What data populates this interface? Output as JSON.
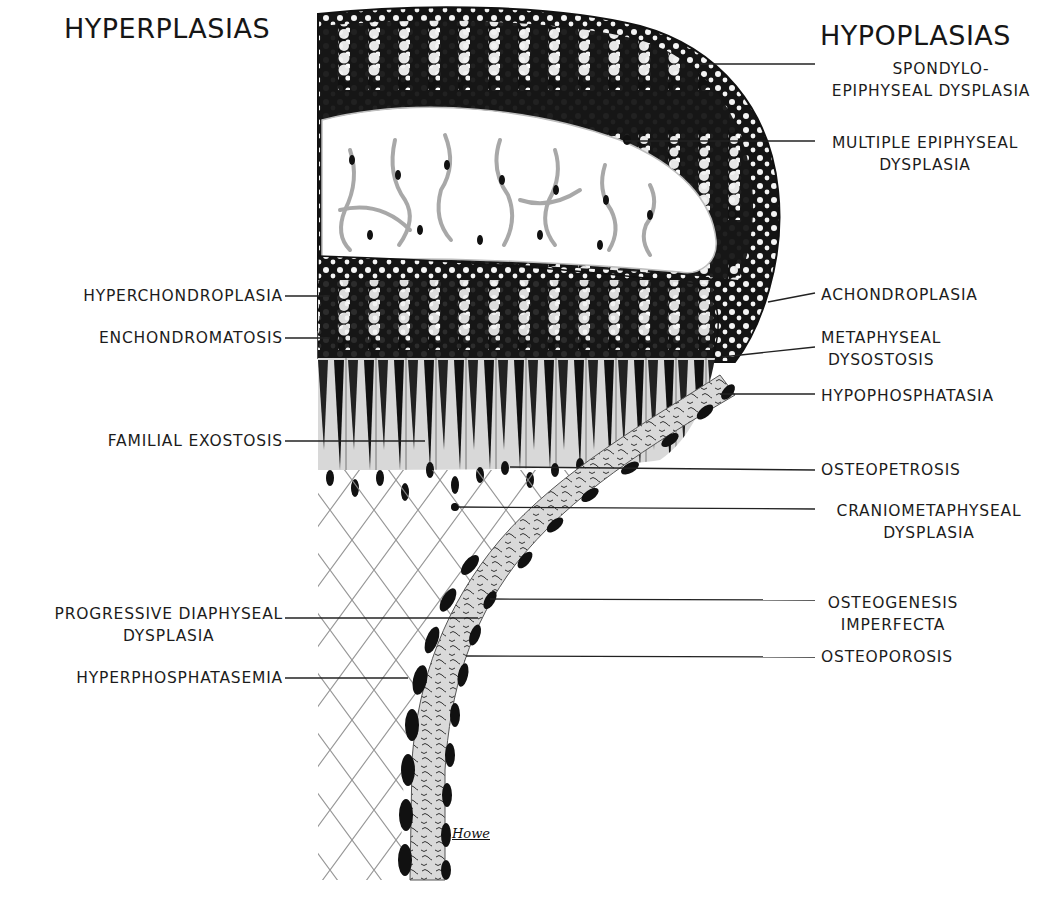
{
  "diagram": {
    "type": "anatomical-illustration",
    "headings": {
      "left": "HYPERPLASIAS",
      "right": "HYPOPLASIAS"
    },
    "left_labels": [
      {
        "id": "hyperchondroplasia",
        "lines": [
          "HYPERCHONDROPLASIA"
        ],
        "y": 296
      },
      {
        "id": "enchondromatosis",
        "lines": [
          "ENCHONDROMATOSIS"
        ],
        "y": 338
      },
      {
        "id": "familial-exostosis",
        "lines": [
          "FAMILIAL EXOSTOSIS"
        ],
        "y": 441
      },
      {
        "id": "progressive-diaphyseal-dysplasia",
        "lines": [
          "PROGRESSIVE DIAPHYSEAL",
          "DYSPLASIA"
        ],
        "y": 618
      },
      {
        "id": "hyperphosphatasemia",
        "lines": [
          "HYPERPHOSPHATASEMIA"
        ],
        "y": 678
      }
    ],
    "right_labels": [
      {
        "id": "spondylo-epiphyseal-dysplasia",
        "lines": [
          "SPONDYLO-",
          "EPIPHYSEAL DYSPLASIA"
        ],
        "y": 66
      },
      {
        "id": "multiple-epiphyseal-dysplasia",
        "lines": [
          "MULTIPLE EPIPHYSEAL",
          "DYSPLASIA"
        ],
        "y": 142
      },
      {
        "id": "achondroplasia",
        "lines": [
          "ACHONDROPLASIA"
        ],
        "y": 296
      },
      {
        "id": "metaphyseal-dysostosis",
        "lines": [
          "METAPHYSEAL",
          "DYSOSTOSIS"
        ],
        "y": 348
      },
      {
        "id": "hypophosphatasia",
        "lines": [
          "HYPOPHOSPHATASIA"
        ],
        "y": 396
      },
      {
        "id": "osteopetrosis",
        "lines": [
          "OSTEOPETROSIS"
        ],
        "y": 470
      },
      {
        "id": "craniometaphyseal-dysplasia",
        "lines": [
          "CRANIOMETAPHYSEAL",
          "DYSPLASIA"
        ],
        "y": 509
      },
      {
        "id": "osteogenesis-imperfecta",
        "lines": [
          "OSTEOGENESIS",
          "IMPERFECTA"
        ],
        "y": 600
      },
      {
        "id": "osteoporosis",
        "lines": [
          "OSTEOPOROSIS"
        ],
        "y": 657
      }
    ],
    "signature": "Howe",
    "colors": {
      "ink": "#111111",
      "background": "#ffffff",
      "stipple": "#bdbdbd"
    }
  }
}
